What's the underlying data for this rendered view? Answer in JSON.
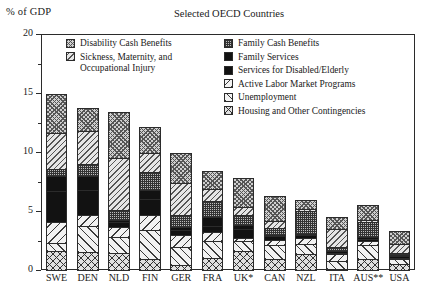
{
  "chart_data": {
    "type": "bar",
    "subtype": "stacked-bar",
    "title": "Selected OECD Countries",
    "ylabel": "% of GDP",
    "xlabel": "",
    "ylim": [
      0,
      20
    ],
    "yticks": [
      0,
      5,
      10,
      15,
      20
    ],
    "ytick_labels": [
      "0",
      "5",
      "10",
      "15",
      "20"
    ],
    "yminor_ticks": [
      2.5,
      7.5,
      12.5,
      17.5
    ],
    "grid": false,
    "legend_position": "inside-upper-right",
    "categories": [
      "SWE",
      "DEN",
      "NLD",
      "FIN",
      "GER",
      "FRA",
      "UK*",
      "CAN",
      "NZL",
      "ITA",
      "AUS**",
      "USA"
    ],
    "stack_order_bottom_to_top": [
      "Housing and Other Contingencies",
      "Unemployment",
      "Active Labor Market Programs",
      "Services for Disabled/Elderly",
      "Family Services",
      "Family Cash Benefits",
      "Sickness, Maternity, and Occupational Injury",
      "Disability Cash Benefits"
    ],
    "series": [
      {
        "name": "Housing and Other Contingencies",
        "pattern": "crosshatch-coarse",
        "values": [
          1.7,
          1.6,
          1.5,
          1.0,
          0.5,
          1.1,
          1.7,
          1.0,
          1.4,
          0.2,
          1.0,
          0.6
        ]
      },
      {
        "name": "Unemployment",
        "pattern": "diagonal-forward",
        "values": [
          0.8,
          2.3,
          1.5,
          2.6,
          1.6,
          1.5,
          0.9,
          1.3,
          1.0,
          0.7,
          1.3,
          0.5
        ]
      },
      {
        "name": "Active Labor Market Programs",
        "pattern": "diagonal-back",
        "values": [
          1.8,
          1.0,
          0.9,
          1.3,
          1.1,
          0.9,
          0.4,
          0.5,
          0.6,
          0.7,
          0.4,
          0.2
        ]
      },
      {
        "name": "Services for Disabled/Elderly",
        "pattern": "solid-black",
        "values": [
          2.7,
          2.2,
          0.5,
          1.5,
          0.5,
          0.6,
          0.8,
          0.4,
          0.3,
          0.2,
          0.3,
          0.2
        ]
      },
      {
        "name": "Family Services",
        "pattern": "solid-black",
        "values": [
          1.4,
          1.3,
          0.3,
          0.8,
          0.4,
          0.8,
          0.4,
          0.1,
          0.2,
          0.2,
          0.2,
          0.1
        ]
      },
      {
        "name": "Family Cash Benefits",
        "pattern": "checker-fine",
        "values": [
          0.7,
          1.1,
          0.9,
          1.6,
          1.1,
          1.5,
          1.0,
          0.7,
          2.0,
          0.5,
          1.4,
          0.3
        ]
      },
      {
        "name": "Sickness, Maternity, and Occupational Injury",
        "pattern": "diagonal-light",
        "values": [
          3.1,
          2.9,
          4.5,
          1.7,
          2.8,
          1.1,
          0.7,
          0.7,
          0.3,
          1.6,
          0.2,
          0.8
        ]
      },
      {
        "name": "Disability Cash Benefits",
        "pattern": "crosshatch-fine",
        "values": [
          3.4,
          2.0,
          4.0,
          2.3,
          2.6,
          1.6,
          2.6,
          2.2,
          0.8,
          1.1,
          1.4,
          1.2
        ]
      }
    ],
    "totals": [
      15.6,
      14.4,
      14.1,
      12.8,
      10.6,
      9.1,
      8.5,
      6.9,
      6.6,
      5.2,
      5.2,
      3.9
    ],
    "annotations": [
      "UK*",
      "AUS**"
    ]
  },
  "legend": {
    "left_column": [
      {
        "label": "Disability Cash Benefits",
        "pattern": "p-disability"
      },
      {
        "label": "Sickness, Maternity, and\nOccupational Injury",
        "pattern": "p-sickness"
      }
    ],
    "right_column": [
      {
        "label": "Family Cash Benefits",
        "pattern": "p-familycash"
      },
      {
        "label": "Family Services",
        "pattern": "p-familyserv"
      },
      {
        "label": "Services for Disabled/Elderly",
        "pattern": "p-disabledserv"
      },
      {
        "label": "Active Labor Market Programs",
        "pattern": "p-almp"
      },
      {
        "label": "Unemployment",
        "pattern": "p-unemployment"
      },
      {
        "label": "Housing and Other Contingencies",
        "pattern": "p-housing"
      }
    ]
  }
}
